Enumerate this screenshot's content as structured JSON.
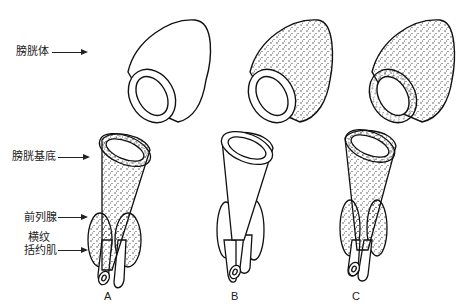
{
  "labels": {
    "bladder_body": "膀胱体",
    "bladder_base": "膀胱基底",
    "prostate": "前列腺",
    "sphincter_line1": "横纹",
    "sphincter_line2": "括约肌"
  },
  "columns": [
    {
      "id": "A",
      "label": "A"
    },
    {
      "id": "B",
      "label": "B"
    },
    {
      "id": "C",
      "label": "C"
    }
  ],
  "colors": {
    "line": "#111111",
    "stipple": "#333333",
    "background": "#ffffff"
  }
}
